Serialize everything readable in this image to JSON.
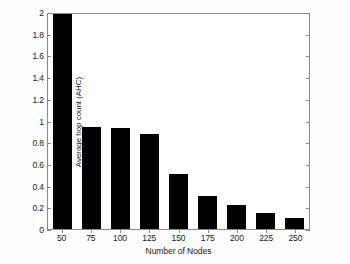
{
  "chart_data": {
    "type": "bar",
    "title": "",
    "subtitle": "",
    "xlabel": "Number of Nodes",
    "ylabel": "Average hop count (AHC)",
    "categories": [
      "50",
      "75",
      "100",
      "125",
      "150",
      "175",
      "200",
      "225",
      "250"
    ],
    "values": [
      2.0,
      0.95,
      0.94,
      0.88,
      0.51,
      0.31,
      0.22,
      0.15,
      0.1
    ],
    "series": [
      {
        "name": "Average hop count (AHC)",
        "values": [
          2.0,
          0.95,
          0.94,
          0.88,
          0.51,
          0.31,
          0.22,
          0.15,
          0.1
        ]
      }
    ],
    "ylim": [
      0,
      2
    ],
    "xlim": [
      0,
      9
    ],
    "yticks": [
      0,
      0.2,
      0.4,
      0.6,
      0.8,
      1,
      1.2,
      1.4,
      1.6,
      1.8,
      2
    ],
    "ytick_labels": [
      "0",
      "0.2",
      "0.4",
      "0.6",
      "0.8",
      "1",
      "1.2",
      "1.4",
      "1.6",
      "1.8",
      "2"
    ],
    "xtick_labels": [
      "50",
      "75",
      "100",
      "125",
      "150",
      "175",
      "200",
      "225",
      "250"
    ],
    "grid": false,
    "legend": null,
    "legend_position": "none",
    "bar_color": "#000000",
    "bar_edge_color": "#000000",
    "axis_color": "#8a8a8a",
    "background_color": "#ffffff",
    "annotations": []
  }
}
